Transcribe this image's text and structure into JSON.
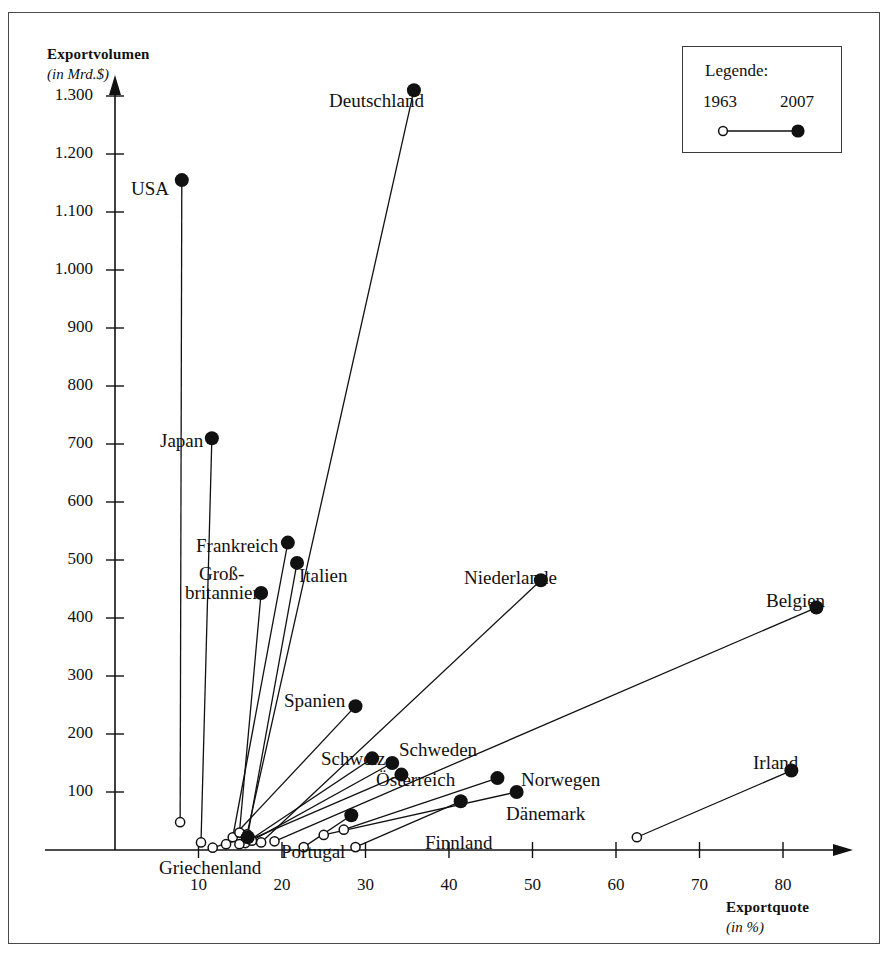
{
  "legend": {
    "title": "Legende:",
    "start_year": "1963",
    "end_year": "2007"
  },
  "axes": {
    "y_title": "Exportvolumen",
    "y_subtitle": "(in Mrd.$)",
    "x_title": "Exportquote",
    "x_subtitle": "(in %)",
    "y_ticks": [
      "100",
      "200",
      "300",
      "400",
      "500",
      "600",
      "700",
      "800",
      "900",
      "1.000",
      "1.100",
      "1.200",
      "1.300"
    ],
    "x_ticks": [
      "10",
      "20",
      "30",
      "40",
      "50",
      "60",
      "70",
      "80"
    ]
  },
  "chart_data": {
    "type": "scatter",
    "title": "",
    "xlabel": "Exportquote (in %)",
    "ylabel": "Exportvolumen (in Mrd.$)",
    "xlim": [
      0,
      90
    ],
    "ylim": [
      0,
      1380
    ],
    "grid": false,
    "legend_position": "top-right",
    "series": [
      {
        "name": "1963",
        "marker": "open-circle"
      },
      {
        "name": "2007",
        "marker": "filled-circle"
      }
    ],
    "points": [
      {
        "label": "USA",
        "x_1963": 7.8,
        "y_1963": 48,
        "x_2007": 8.0,
        "y_2007": 1155
      },
      {
        "label": "Deutschland",
        "x_1963": 15.8,
        "y_1963": 27,
        "x_2007": 35.8,
        "y_2007": 1310
      },
      {
        "label": "Japan",
        "x_1963": 10.3,
        "y_1963": 13,
        "x_2007": 11.6,
        "y_2007": 710
      },
      {
        "label": "Frankreich",
        "x_1963": 14.1,
        "y_1963": 22,
        "x_2007": 20.7,
        "y_2007": 530
      },
      {
        "label": "Italien",
        "x_1963": 15.8,
        "y_1963": 18,
        "x_2007": 21.8,
        "y_2007": 495
      },
      {
        "label": "Groß-britannien",
        "x_1963": 14.9,
        "y_1963": 30,
        "x_2007": 17.5,
        "y_2007": 443
      },
      {
        "label": "Niederlande",
        "x_1963": 17.5,
        "y_1963": 13,
        "x_2007": 51.0,
        "y_2007": 465
      },
      {
        "label": "Belgien",
        "x_1963": 19.1,
        "y_1963": 15,
        "x_2007": 84.0,
        "y_2007": 418
      },
      {
        "label": "Spanien",
        "x_1963": 13.3,
        "y_1963": 10,
        "x_2007": 28.8,
        "y_2007": 248
      },
      {
        "label": "Schweiz",
        "x_1963": 15.6,
        "y_1963": 12,
        "x_2007": 30.8,
        "y_2007": 158
      },
      {
        "label": "Schweden",
        "x_1963": 16.4,
        "y_1963": 16,
        "x_2007": 33.2,
        "y_2007": 150
      },
      {
        "label": "Österreich",
        "x_1963": 14.9,
        "y_1963": 10,
        "x_2007": 34.3,
        "y_2007": 130
      },
      {
        "label": "Norwegen",
        "x_1963": 27.4,
        "y_1963": 35,
        "x_2007": 45.8,
        "y_2007": 124
      },
      {
        "label": "Dänemark",
        "x_1963": 25.0,
        "y_1963": 26,
        "x_2007": 48.1,
        "y_2007": 100
      },
      {
        "label": "Finnland",
        "x_1963": 28.8,
        "y_1963": 5,
        "x_2007": 41.4,
        "y_2007": 84
      },
      {
        "label": "Irland",
        "x_1963": 62.5,
        "y_1963": 22,
        "x_2007": 81.0,
        "y_2007": 137
      },
      {
        "label": "Portugal",
        "x_1963": 22.6,
        "y_1963": 5,
        "x_2007": 28.3,
        "y_2007": 60
      },
      {
        "label": "Griechenland",
        "x_1963": 11.7,
        "y_1963": 4,
        "x_2007": 15.9,
        "y_2007": 22
      }
    ],
    "annotations": [
      {
        "text": "Deutschland",
        "x": 320,
        "y": 78
      },
      {
        "text": "USA",
        "x": 122,
        "y": 166
      },
      {
        "text": "Japan",
        "x": 151,
        "y": 418
      },
      {
        "text": "Frankreich",
        "x": 187,
        "y": 523
      },
      {
        "text": "Groß-",
        "x": 190,
        "y": 551
      },
      {
        "text": "britannien",
        "x": 176,
        "y": 570
      },
      {
        "text": "Italien",
        "x": 290,
        "y": 553
      },
      {
        "text": "Niederlande",
        "x": 455,
        "y": 555
      },
      {
        "text": "Belgien",
        "x": 757,
        "y": 578
      },
      {
        "text": "Spanien",
        "x": 275,
        "y": 678
      },
      {
        "text": "Schweiz",
        "x": 312,
        "y": 736
      },
      {
        "text": "Schweden",
        "x": 390,
        "y": 727
      },
      {
        "text": "Österreich",
        "x": 367,
        "y": 757
      },
      {
        "text": "Norwegen",
        "x": 512,
        "y": 757
      },
      {
        "text": "Dänemark",
        "x": 497,
        "y": 791
      },
      {
        "text": "Irland",
        "x": 744,
        "y": 740
      },
      {
        "text": "Finnland",
        "x": 416,
        "y": 820
      },
      {
        "text": "Portugal",
        "x": 272,
        "y": 829
      },
      {
        "text": "Griechenland",
        "x": 150,
        "y": 845
      }
    ]
  }
}
